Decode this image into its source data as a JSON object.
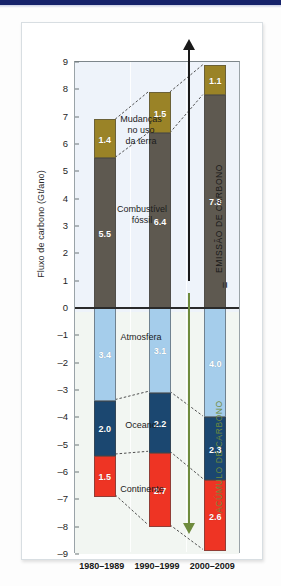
{
  "figure": {
    "y_axis_title": "Fluxo de carbono (Gt/ano)",
    "equals_marker": "=",
    "emission_label": "EMISSÃO DE CARBONO",
    "accumulation_label": "ACÚMULO DE CARBONO",
    "annotations": {
      "land_use": "Mudanças\nno uso\nda terra",
      "land_use_l1": "Mudanças",
      "land_use_l2": "no uso",
      "land_use_l3": "da terra",
      "fossil_l1": "Combustível",
      "fossil_l2": "fóssil",
      "atmosphere": "Atmosfera",
      "ocean": "Oceano",
      "land": "Continente"
    },
    "colors": {
      "land_use": "#9a8327",
      "fossil_fuel": "#5e5950",
      "atmosphere": "#a5cdeb",
      "ocean": "#1b4770",
      "land": "#ee3424",
      "emission_arrow": "#1a1a1a",
      "accumulation_arrow": "#6e8b3d",
      "top_strip": "#16236b"
    }
  },
  "chart_data": {
    "type": "bar",
    "title": "",
    "subtitle": "",
    "xlabel": "",
    "ylabel": "Fluxo de carbono (Gt/ano)",
    "ylim": [
      -9,
      9
    ],
    "yticks": [
      9,
      8,
      7,
      6,
      5,
      4,
      3,
      2,
      1,
      0,
      -1,
      -2,
      -3,
      -4,
      -5,
      -6,
      -7,
      -8,
      -9
    ],
    "ytick_labels": [
      "9",
      "8",
      "7",
      "6",
      "5",
      "4",
      "3",
      "2",
      "1",
      "0",
      "–1",
      "–2",
      "–3",
      "–4",
      "–5",
      "–6",
      "–7",
      "–8",
      "–9"
    ],
    "grid": false,
    "legend_position": "in-plot",
    "stacked": true,
    "categories": [
      "1980–1989",
      "1990–1999",
      "2000–2009"
    ],
    "series": [
      {
        "name": "Combustível fóssil",
        "sign": "positive",
        "color": "#5e5950",
        "values": [
          5.5,
          6.4,
          7.8
        ]
      },
      {
        "name": "Mudanças no uso da terra",
        "sign": "positive",
        "color": "#9a8327",
        "values": [
          1.4,
          1.5,
          1.1
        ]
      },
      {
        "name": "Atmosfera",
        "sign": "negative",
        "color": "#a5cdeb",
        "values": [
          3.4,
          3.1,
          4.0
        ]
      },
      {
        "name": "Oceano",
        "sign": "negative",
        "color": "#1b4770",
        "values": [
          2.0,
          2.2,
          2.3
        ]
      },
      {
        "name": "Continente",
        "sign": "negative",
        "color": "#ee3424",
        "values": [
          1.5,
          2.7,
          2.6
        ]
      }
    ],
    "totals_positive": [
      6.9,
      7.9,
      8.9
    ],
    "totals_negative": [
      6.9,
      8.0,
      8.9
    ]
  }
}
